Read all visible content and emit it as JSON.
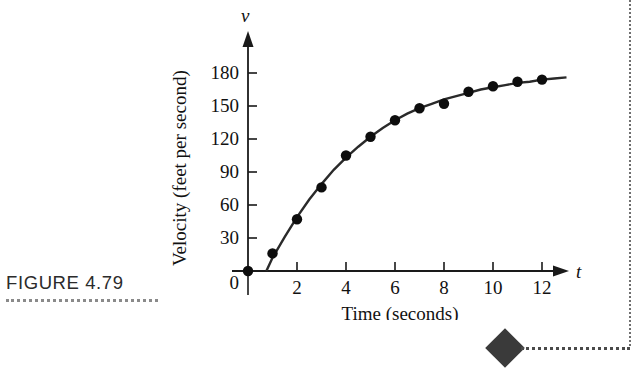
{
  "figure": {
    "caption": "FIGURE 4.79"
  },
  "chart_data": {
    "type": "scatter",
    "title": "",
    "xlabel": "Time (seconds)",
    "ylabel": "Velocity (feet per second)",
    "x_axis_variable": "t",
    "y_axis_variable": "v",
    "xlim": [
      0,
      13.6
    ],
    "ylim": [
      0,
      195
    ],
    "xticks": [
      2,
      4,
      6,
      8,
      10,
      12
    ],
    "xtick_labels": [
      "2",
      "4",
      "6",
      "8",
      "10",
      "12"
    ],
    "yticks": [
      30,
      60,
      90,
      120,
      150,
      180
    ],
    "ytick_labels": [
      "30",
      "60",
      "90",
      "120",
      "150",
      "180"
    ],
    "origin_label": "0",
    "grid": false,
    "legend": false,
    "series": [
      {
        "name": "Observed velocity",
        "marker": "filled-circle",
        "x": [
          0,
          1,
          2,
          3,
          4,
          5,
          6,
          7,
          8,
          9,
          10,
          11,
          12
        ],
        "values": [
          0,
          16,
          47,
          76,
          105,
          122,
          137,
          148,
          152,
          163,
          168,
          172,
          174
        ]
      },
      {
        "name": "Fitted curve",
        "marker": "line",
        "x": [
          0.75,
          1,
          1.5,
          2,
          2.5,
          3,
          3.5,
          4,
          4.5,
          5,
          5.5,
          6,
          6.5,
          7,
          7.5,
          8,
          8.5,
          9,
          9.5,
          10,
          10.5,
          11,
          11.5,
          12,
          12.5,
          13
        ],
        "values": [
          0,
          12,
          31,
          49,
          65,
          79,
          92,
          103,
          113,
          122,
          130,
          137,
          143,
          148,
          152,
          156,
          159,
          162,
          165,
          167,
          169,
          171,
          172,
          174,
          175,
          176
        ]
      }
    ]
  },
  "colors": {
    "curve": "#2a2a2a",
    "point": "#0d0d0d",
    "axis": "#1a1a1a",
    "caption": "#2b2b2b",
    "marker": "#3a3a3a"
  }
}
